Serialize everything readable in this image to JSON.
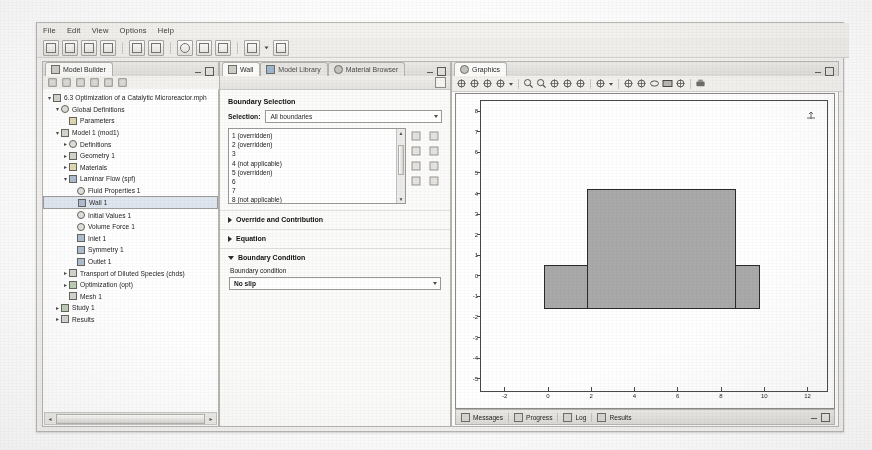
{
  "app": {
    "menu": [
      "File",
      "Edit",
      "View",
      "Options",
      "Help"
    ],
    "toolbar_icons": [
      "new-icon",
      "open-icon",
      "save-icon",
      "print-icon",
      "undo-icon",
      "redo-icon",
      "refresh-icon",
      "copy-icon",
      "paste-icon",
      "build-icon",
      "dropdown-arrow-icon",
      "table-icon"
    ]
  },
  "model_builder": {
    "tab_label": "Model Builder",
    "tab_icon": "model-builder-icon",
    "tools": [
      "collapse-icon",
      "expand-icon",
      "move-up-icon",
      "move-down-icon",
      "sort-icon",
      "filter-icon"
    ],
    "tree": [
      {
        "label": "6.3 Optimization of a Catalytic Microreactor.mph",
        "depth": 0,
        "arrow": "down",
        "icon": "model-root-icon",
        "selected": false
      },
      {
        "label": "Global Definitions",
        "depth": 1,
        "arrow": "down",
        "icon": "global-definitions-icon",
        "selected": false
      },
      {
        "label": "Parameters",
        "depth": 2,
        "arrow": "none",
        "icon": "parameters-icon",
        "selected": false
      },
      {
        "label": "Model 1 (mod1)",
        "depth": 1,
        "arrow": "down",
        "icon": "model-icon",
        "selected": false
      },
      {
        "label": "Definitions",
        "depth": 2,
        "arrow": "right",
        "icon": "definitions-icon",
        "selected": false
      },
      {
        "label": "Geometry 1",
        "depth": 2,
        "arrow": "right",
        "icon": "geometry-icon",
        "selected": false
      },
      {
        "label": "Materials",
        "depth": 2,
        "arrow": "right",
        "icon": "materials-icon",
        "selected": false
      },
      {
        "label": "Laminar Flow (spf)",
        "depth": 2,
        "arrow": "down",
        "icon": "laminar-flow-icon",
        "selected": false
      },
      {
        "label": "Fluid Properties 1",
        "depth": 3,
        "arrow": "none",
        "icon": "fluid-properties-icon",
        "selected": false
      },
      {
        "label": "Wall 1",
        "depth": 3,
        "arrow": "none",
        "icon": "wall-icon",
        "selected": true
      },
      {
        "label": "Initial Values 1",
        "depth": 3,
        "arrow": "none",
        "icon": "initial-values-icon",
        "selected": false
      },
      {
        "label": "Volume Force 1",
        "depth": 3,
        "arrow": "none",
        "icon": "volume-force-icon",
        "selected": false
      },
      {
        "label": "Inlet 1",
        "depth": 3,
        "arrow": "none",
        "icon": "inlet-icon",
        "selected": false
      },
      {
        "label": "Symmetry 1",
        "depth": 3,
        "arrow": "none",
        "icon": "symmetry-icon",
        "selected": false
      },
      {
        "label": "Outlet 1",
        "depth": 3,
        "arrow": "none",
        "icon": "outlet-icon",
        "selected": false
      },
      {
        "label": "Transport of Diluted Species (chds)",
        "depth": 2,
        "arrow": "right",
        "icon": "transport-species-icon",
        "selected": false
      },
      {
        "label": "Optimization (opt)",
        "depth": 2,
        "arrow": "right",
        "icon": "optimization-icon",
        "selected": false
      },
      {
        "label": "Mesh 1",
        "depth": 2,
        "arrow": "none",
        "icon": "mesh-icon",
        "selected": false
      },
      {
        "label": "Study 1",
        "depth": 1,
        "arrow": "right",
        "icon": "study-icon",
        "selected": false
      },
      {
        "label": "Results",
        "depth": 1,
        "arrow": "right",
        "icon": "results-icon",
        "selected": false
      }
    ]
  },
  "settings": {
    "tabs": [
      {
        "label": "Wall",
        "icon": "wall-icon",
        "active": true
      },
      {
        "label": "Model Library",
        "icon": "model-library-icon",
        "active": false
      },
      {
        "label": "Material Browser",
        "icon": "material-browser-icon",
        "active": false
      }
    ],
    "boundary_selection": {
      "heading": "Boundary Selection",
      "selection_label": "Selection:",
      "selection_value": "All boundaries",
      "items": [
        "1 (overridden)",
        "2 (overridden)",
        "3",
        "4 (not applicable)",
        "5 (overridden)",
        "6",
        "7",
        "8 (not applicable)"
      ],
      "side_buttons": [
        "active-selection-icon",
        "zoom-selected-icon",
        "copy-selection-icon",
        "paste-selection-icon",
        "add-to-selection-icon",
        "remove-from-selection-icon",
        "clear-selection-icon",
        "paste-icon"
      ]
    },
    "sections": [
      {
        "title": "Override and Contribution",
        "expanded": false
      },
      {
        "title": "Equation",
        "expanded": false
      },
      {
        "title": "Boundary Condition",
        "expanded": true
      }
    ],
    "boundary_condition": {
      "field_label": "Boundary condition",
      "value": "No slip"
    }
  },
  "graphics": {
    "tab_label": "Graphics",
    "tab_icon": "graphics-icon",
    "toolbar_icons": [
      "zoom-in-scene-icon",
      "zoom-out-scene-icon",
      "rotate-icon",
      "scene-light-icon",
      "dropdown-arrow-icon",
      "zoom-in-icon",
      "zoom-out-icon",
      "zoom-box-icon",
      "zoom-extents-icon",
      "zoom-selection-icon",
      "orthographic-icon",
      "camera-dropdown-icon",
      "select-box-icon",
      "select-lasso-icon",
      "select-circle-icon",
      "select-all-icon",
      "deselect-icon",
      "print-graphics-icon"
    ],
    "plot": {
      "y_ticks": [
        "8",
        "7",
        "6",
        "5",
        "4",
        "3",
        "2",
        "1",
        "0",
        "-1",
        "-2",
        "-3",
        "-4",
        "-5"
      ],
      "x_ticks": [
        "-2",
        "0",
        "2",
        "4",
        "6",
        "8",
        "10",
        "12"
      ],
      "x_range": [
        -3.1,
        12.9
      ],
      "y_range": [
        -5.6,
        8.5
      ],
      "orientation_marker": "axis-orientation-icon",
      "geometry": [
        {
          "name": "channel-base",
          "x0": -0.2,
          "x1": 9.7,
          "y0": -1.5,
          "y1": 0.55
        },
        {
          "name": "reactor-block",
          "x0": 1.8,
          "x1": 8.6,
          "y0": -1.5,
          "y1": 4.2
        }
      ]
    },
    "status_tabs": [
      {
        "label": "Messages",
        "icon": "messages-icon"
      },
      {
        "label": "Progress",
        "icon": "progress-icon"
      },
      {
        "label": "Log",
        "icon": "log-icon"
      },
      {
        "label": "Results",
        "icon": "results-icon"
      }
    ]
  }
}
